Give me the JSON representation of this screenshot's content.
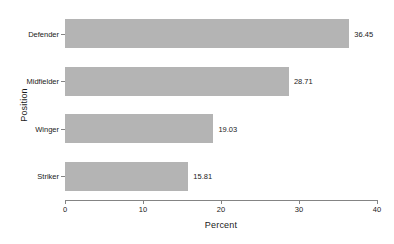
{
  "chart_data": {
    "type": "bar",
    "orientation": "horizontal",
    "title": "",
    "xlabel": "Percent",
    "ylabel": "Position",
    "categories": [
      "Defender",
      "Midfielder",
      "Winger",
      "Striker"
    ],
    "values": [
      36.45,
      28.71,
      19.03,
      15.81
    ],
    "value_labels": [
      "36.45",
      "28.71",
      "19.03",
      "15.81"
    ],
    "xlim": [
      0,
      40
    ],
    "xticks": [
      0,
      10,
      20,
      30,
      40
    ],
    "xtick_labels": [
      "0",
      "10",
      "20",
      "30",
      "40"
    ],
    "grid": false,
    "legend": false,
    "bar_color": "#b4b4b4",
    "axis_color": "#848484",
    "text_color": "#1a1a1a",
    "background": "#ffffff"
  }
}
